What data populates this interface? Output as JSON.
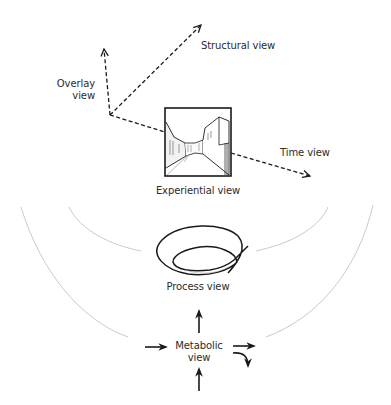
{
  "diagram": {
    "type": "conceptual-views",
    "axes": {
      "structural": {
        "label": "Structural view",
        "direction": "up-right"
      },
      "overlay": {
        "label_line1": "Overlay",
        "label_line2": "view",
        "direction": "up"
      },
      "time": {
        "label": "Time view",
        "direction": "down-right"
      }
    },
    "experiential": {
      "label": "Experiential view",
      "image": "street-perspective-sketch"
    },
    "process": {
      "label": "Process view",
      "image": "spiral-loop"
    },
    "metabolic": {
      "label_line1": "Metabolic",
      "label_line2": "view",
      "arrows": [
        "in-left",
        "out-up",
        "in-bottom",
        "out-right",
        "out-right-curved-down"
      ]
    },
    "arcs": {
      "count": 4,
      "color": "#bdbdbd"
    },
    "colors": {
      "line": "#1a1a1a",
      "arc": "#bdbdbd",
      "background": "#ffffff"
    }
  }
}
